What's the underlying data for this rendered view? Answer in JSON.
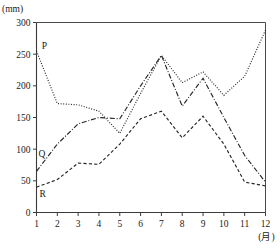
{
  "chart_data": {
    "type": "line",
    "title": "",
    "subtitle": "",
    "xlabel": "(月)",
    "ylabel": "",
    "yunit": "(mm)",
    "x": [
      1,
      2,
      3,
      4,
      5,
      6,
      7,
      8,
      9,
      10,
      11,
      12
    ],
    "xticklabels": [
      "1",
      "2",
      "3",
      "4",
      "5",
      "6",
      "7",
      "8",
      "9",
      "10",
      "11",
      "12"
    ],
    "yticklabels": [
      "0",
      "50",
      "100",
      "150",
      "200",
      "250",
      "300"
    ],
    "yticks": [
      0,
      50,
      100,
      150,
      200,
      250,
      300
    ],
    "xlim": [
      1,
      12
    ],
    "ylim": [
      0,
      300
    ],
    "grid": false,
    "legend_position": "inline-labels",
    "series": [
      {
        "name": "P",
        "label": "P",
        "style": "dotted",
        "color": "#262626",
        "label_x": 1.25,
        "label_y": 258,
        "values": [
          255,
          172,
          170,
          160,
          125,
          188,
          248,
          205,
          222,
          185,
          215,
          288
        ]
      },
      {
        "name": "Q",
        "label": "Q",
        "style": "dash-dot",
        "color": "#262626",
        "label_x": 1.1,
        "label_y": 88,
        "values": [
          65,
          108,
          140,
          150,
          148,
          200,
          248,
          168,
          212,
          150,
          90,
          48
        ]
      },
      {
        "name": "R",
        "label": "R",
        "style": "dashed",
        "color": "#262626",
        "label_x": 1.15,
        "label_y": 25,
        "values": [
          40,
          52,
          78,
          76,
          108,
          148,
          160,
          118,
          152,
          108,
          48,
          42
        ]
      }
    ]
  }
}
